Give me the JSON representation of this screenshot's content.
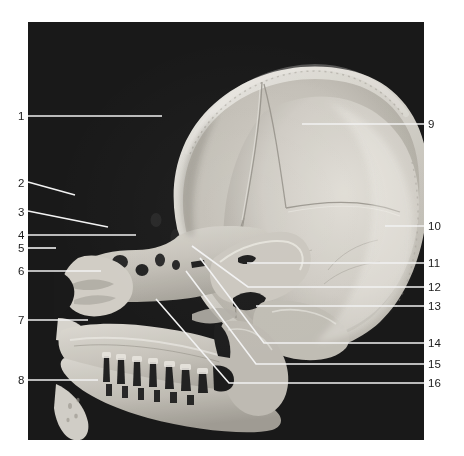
{
  "figure": {
    "kind": "anatomical-photograph",
    "background_color": "#080808",
    "page_background_color": "#ffffff",
    "leader_line_color": "#f2f2f2",
    "label_text_color": "#1b1b1b",
    "plate": {
      "x": 28,
      "y": 22,
      "width": 396,
      "height": 418
    }
  },
  "labels": {
    "left": [
      {
        "id": "1",
        "text": "1",
        "x": 18,
        "y": 110,
        "line": [
          [
            28,
            116
          ],
          [
            162,
            116
          ]
        ]
      },
      {
        "id": "2",
        "text": "2",
        "x": 18,
        "y": 177,
        "line": [
          [
            28,
            182
          ],
          [
            75,
            195
          ]
        ]
      },
      {
        "id": "3",
        "text": "3",
        "x": 18,
        "y": 206,
        "line": [
          [
            28,
            211
          ],
          [
            108,
            227
          ]
        ]
      },
      {
        "id": "4",
        "text": "4",
        "x": 18,
        "y": 229,
        "line": [
          [
            28,
            235
          ],
          [
            136,
            235
          ]
        ]
      },
      {
        "id": "5",
        "text": "5",
        "x": 18,
        "y": 242,
        "line": [
          [
            28,
            248
          ],
          [
            56,
            248
          ]
        ]
      },
      {
        "id": "6",
        "text": "6",
        "x": 18,
        "y": 265,
        "line": [
          [
            28,
            271
          ],
          [
            101,
            271
          ]
        ]
      },
      {
        "id": "7",
        "text": "7",
        "x": 18,
        "y": 314,
        "line": [
          [
            28,
            320
          ],
          [
            88,
            320
          ]
        ]
      },
      {
        "id": "8",
        "text": "8",
        "x": 18,
        "y": 374,
        "line": [
          [
            28,
            380
          ],
          [
            98,
            380
          ]
        ]
      }
    ],
    "right": [
      {
        "id": "9",
        "text": "9",
        "x": 428,
        "y": 118,
        "line": [
          [
            424,
            124
          ],
          [
            302,
            124
          ]
        ]
      },
      {
        "id": "10",
        "text": "10",
        "x": 428,
        "y": 220,
        "line": [
          [
            424,
            226
          ],
          [
            385,
            226
          ]
        ]
      },
      {
        "id": "11",
        "text": "11",
        "x": 428,
        "y": 257,
        "line": [
          [
            424,
            263
          ],
          [
            247,
            263
          ]
        ]
      },
      {
        "id": "12",
        "text": "12",
        "x": 428,
        "y": 281,
        "line": [
          [
            424,
            287
          ],
          [
            248,
            287
          ],
          [
            192,
            246
          ]
        ]
      },
      {
        "id": "13",
        "text": "13",
        "x": 428,
        "y": 300,
        "line": [
          [
            424,
            306
          ],
          [
            256,
            306
          ]
        ]
      },
      {
        "id": "14",
        "text": "14",
        "x": 428,
        "y": 337,
        "line": [
          [
            424,
            343
          ],
          [
            264,
            343
          ],
          [
            200,
            258
          ]
        ]
      },
      {
        "id": "15",
        "text": "15",
        "x": 428,
        "y": 358,
        "line": [
          [
            424,
            364
          ],
          [
            256,
            364
          ],
          [
            186,
            271
          ]
        ]
      },
      {
        "id": "16",
        "text": "16",
        "x": 428,
        "y": 377,
        "line": [
          [
            424,
            383
          ],
          [
            229,
            383
          ],
          [
            156,
            299
          ]
        ]
      }
    ]
  }
}
